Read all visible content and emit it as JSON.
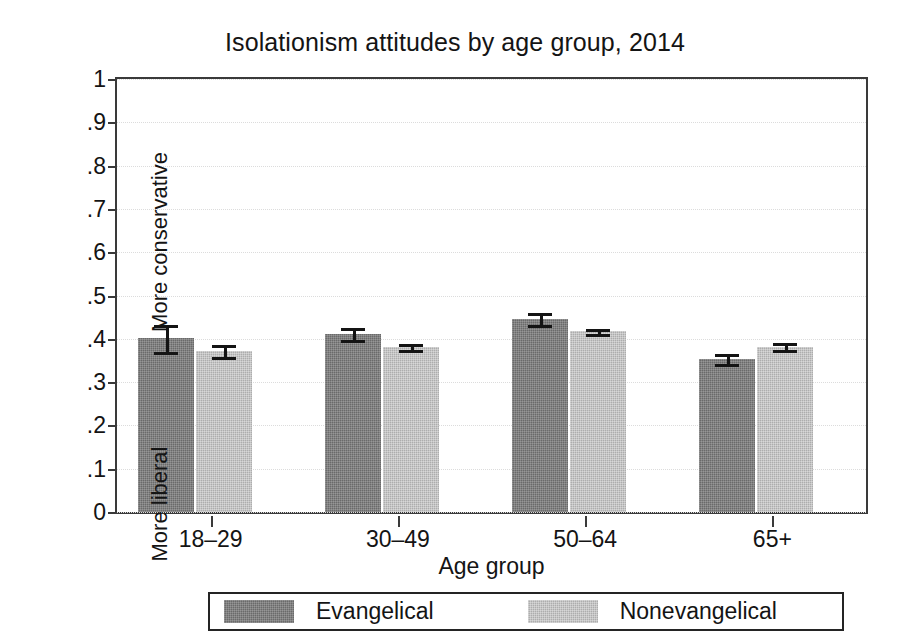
{
  "chart_data": {
    "type": "bar",
    "title": "Isolationism attitudes by age group, 2014",
    "xlabel": "Age group",
    "ylabel": "",
    "ylim": [
      0,
      1
    ],
    "grid": true,
    "legend_position": "bottom",
    "categories": [
      "18–29",
      "30–49",
      "50–64",
      "65+"
    ],
    "ytick_labels": [
      "0",
      ".1",
      ".2",
      ".3",
      ".4",
      ".5",
      ".6",
      ".7",
      ".8",
      ".9",
      "1"
    ],
    "ytick_values": [
      0,
      0.1,
      0.2,
      0.3,
      0.4,
      0.5,
      0.6,
      0.7,
      0.8,
      0.9,
      1
    ],
    "y_axis_captions": {
      "high": "More conservative",
      "low": "More liberal"
    },
    "series": [
      {
        "name": "Evangelical",
        "color": "#6a6a6a",
        "values": [
          0.401,
          0.411,
          0.445,
          0.353
        ],
        "error_low": [
          0.37,
          0.398,
          0.432,
          0.341
        ],
        "error_high": [
          0.432,
          0.424,
          0.459,
          0.366
        ]
      },
      {
        "name": "Nonevangelical",
        "color": "#adadad",
        "values": [
          0.371,
          0.381,
          0.417,
          0.382
        ],
        "error_low": [
          0.357,
          0.375,
          0.411,
          0.374
        ],
        "error_high": [
          0.386,
          0.387,
          0.423,
          0.391
        ]
      }
    ]
  },
  "legend": {
    "entries": [
      {
        "label": "Evangelical"
      },
      {
        "label": "Nonevangelical"
      }
    ]
  }
}
